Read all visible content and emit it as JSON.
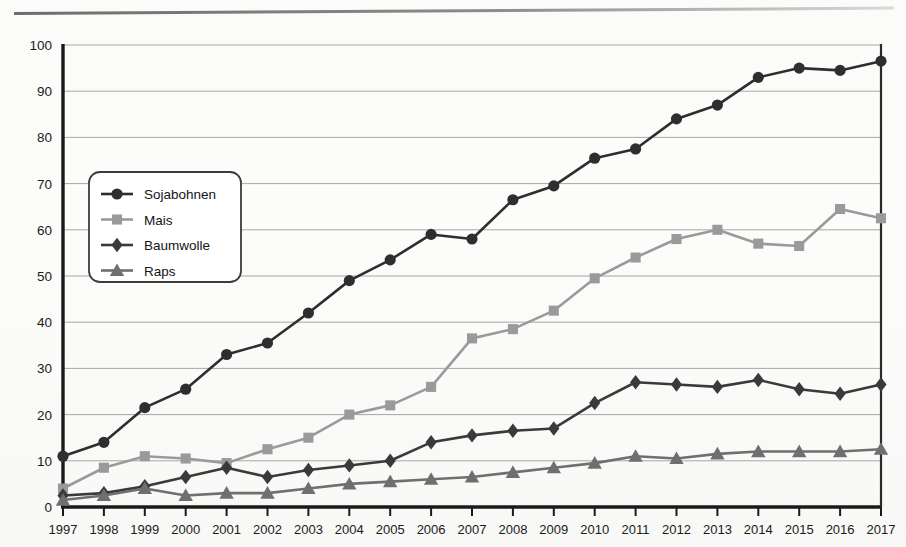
{
  "figure": {
    "top_rule": "horizontal-rule",
    "background": "#fdfdfb"
  },
  "chart_data": {
    "type": "line",
    "title": "",
    "subtitle": "",
    "xlabel": "",
    "ylabel": "",
    "xlim": [
      1997,
      2017
    ],
    "ylim": [
      0,
      100
    ],
    "ytick_step": 10,
    "grid": "horizontal",
    "legend_position": "upper-left-inside",
    "categories": [
      "1997",
      "1998",
      "1999",
      "2000",
      "2001",
      "2002",
      "2003",
      "2004",
      "2005",
      "2006",
      "2007",
      "2008",
      "2009",
      "2010",
      "2011",
      "2012",
      "2013",
      "2014",
      "2015",
      "2016",
      "2017"
    ],
    "x": [
      1997,
      1998,
      1999,
      2000,
      2001,
      2002,
      2003,
      2004,
      2005,
      2006,
      2007,
      2008,
      2009,
      2010,
      2011,
      2012,
      2013,
      2014,
      2015,
      2016,
      2017
    ],
    "yticks": [
      0,
      10,
      20,
      30,
      40,
      50,
      60,
      70,
      80,
      90,
      100
    ],
    "ytick_labels": [
      "0",
      "10",
      "20",
      "30",
      "40",
      "50",
      "60",
      "70",
      "80",
      "90",
      "100"
    ],
    "series": [
      {
        "name": "Sojabohnen",
        "marker": "circle",
        "color": "#2e2e2e",
        "values": [
          11,
          14,
          21.5,
          25.5,
          33,
          35.5,
          42,
          49,
          53.5,
          59,
          58,
          66.5,
          69.5,
          75.5,
          77.5,
          84,
          87,
          93,
          95,
          94.5,
          96.5
        ]
      },
      {
        "name": "Mais",
        "marker": "square",
        "color": "#9a9a9a",
        "values": [
          4,
          8.5,
          11,
          10.5,
          9.5,
          12.5,
          15,
          20,
          22,
          26,
          36.5,
          38.5,
          42.5,
          49.5,
          54,
          58,
          60,
          57,
          56.5,
          64.5,
          62.5
        ]
      },
      {
        "name": "Baumwolle",
        "marker": "diamond",
        "color": "#3a3a3a",
        "values": [
          2.5,
          3,
          4.5,
          6.5,
          8.5,
          6.5,
          8,
          9,
          10,
          14,
          15.5,
          16.5,
          17,
          22.5,
          27,
          26.5,
          26,
          27.5,
          25.5,
          24.5,
          26.5
        ]
      },
      {
        "name": "Raps",
        "marker": "triangle",
        "color": "#6f6f6f",
        "values": [
          1.5,
          2.5,
          4,
          2.5,
          3,
          3,
          4,
          5,
          5.5,
          6,
          6.5,
          7.5,
          8.5,
          9.5,
          11,
          10.5,
          11.5,
          12,
          12,
          12,
          12.5
        ]
      }
    ]
  },
  "legend": {
    "items": [
      {
        "label": "Sojabohnen",
        "marker": "circle",
        "color": "#2e2e2e"
      },
      {
        "label": "Mais",
        "marker": "square",
        "color": "#9a9a9a"
      },
      {
        "label": "Baumwolle",
        "marker": "diamond",
        "color": "#3a3a3a"
      },
      {
        "label": "Raps",
        "marker": "triangle",
        "color": "#6f6f6f"
      }
    ]
  }
}
